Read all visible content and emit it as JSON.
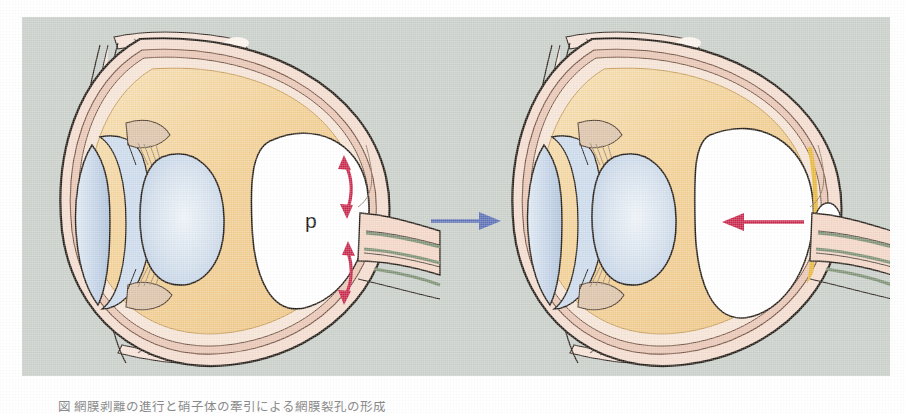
{
  "figure": {
    "panel_background_color": "#c9cfc9",
    "page_background_color": "#ffffff",
    "caption_text": "図 網膜剥離の進行と硝子体の牽引による網膜裂孔の形成",
    "transition_arrow": {
      "name": "blue-transition-arrow",
      "direction": "right",
      "color": "#5a6fb5"
    },
    "panels": [
      {
        "id": "left",
        "name": "eye-before",
        "cavity_label": "p",
        "arrows": [
          {
            "name": "red-double-arrow-upper",
            "style": "double-headed",
            "color": "#c8254a"
          },
          {
            "name": "red-double-arrow-lower",
            "style": "double-headed",
            "color": "#c8254a"
          }
        ]
      },
      {
        "id": "right",
        "name": "eye-after",
        "cavity_label": "",
        "arrows": [
          {
            "name": "red-single-arrow",
            "style": "single-headed",
            "direction": "left",
            "color": "#c8254a"
          }
        ]
      }
    ],
    "anatomy": {
      "sclera": {
        "label": "sclera",
        "color": "#f4d9cc"
      },
      "choroid": {
        "label": "choroid",
        "color": "#e8c3b2"
      },
      "retina_detached": {
        "label": "detached-retina",
        "color": "#e8b83c"
      },
      "vitreous": {
        "label": "vitreous-body",
        "color": "#f0cc8e"
      },
      "lens": {
        "label": "lens",
        "color": "#ccd9e8"
      },
      "cornea": {
        "label": "cornea",
        "color": "#c3d3e6"
      },
      "anterior_chamber": {
        "label": "anterior-chamber",
        "color": "#d7e2ef"
      },
      "subretinal_fluid": {
        "label": "subretinal-fluid-cavity",
        "color": "#ffffff"
      },
      "optic_nerve": {
        "label": "optic-nerve",
        "color": "#f3d6c6"
      },
      "optic_nerve_striation": {
        "label": "optic-nerve-striation",
        "color": "#7d9074"
      },
      "optic_disc": {
        "label": "optic-disc",
        "color": "#ffffff"
      },
      "ciliary_body": {
        "label": "ciliary-body",
        "color": "#d8c2ad"
      },
      "outline": {
        "label": "ink-outline",
        "color": "#231c16"
      }
    }
  }
}
